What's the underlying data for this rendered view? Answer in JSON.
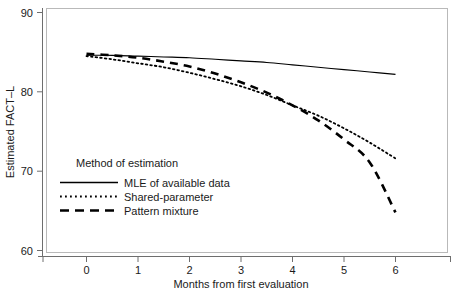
{
  "chart_data": {
    "type": "line",
    "title": "",
    "xlabel": "Months from first evaluation",
    "ylabel": "Estimated FACT–L",
    "xlim": [
      -0.65,
      6.65
    ],
    "ylim": [
      59.0,
      90.6
    ],
    "xticks": [
      0,
      1,
      2,
      3,
      4,
      5,
      6
    ],
    "xtick_labels": [
      "0",
      "1",
      "2",
      "3",
      "4",
      "5",
      "6"
    ],
    "yticks": [
      60,
      70,
      80,
      90
    ],
    "ytick_labels": [
      "60",
      "70",
      "80",
      "90"
    ],
    "grid": false,
    "legend_position": "inside-lower-left",
    "legend_title": "Method of estimation",
    "x": [
      0,
      0.5,
      1,
      1.5,
      2,
      2.5,
      3,
      3.5,
      4,
      4.5,
      5,
      5.5,
      6
    ],
    "series": [
      {
        "name": "MLE of available data",
        "style": "solid",
        "color": "#000000",
        "values": [
          84.6,
          84.6,
          84.5,
          84.4,
          84.3,
          84.1,
          83.9,
          83.7,
          83.4,
          83.1,
          82.8,
          82.5,
          82.2
        ]
      },
      {
        "name": "Shared-parameter",
        "style": "dotted",
        "color": "#000000",
        "values": [
          84.5,
          84.1,
          83.6,
          83.1,
          82.4,
          81.6,
          80.7,
          79.6,
          78.3,
          77.0,
          75.4,
          73.6,
          71.6
        ]
      },
      {
        "name": "Pattern mixture",
        "style": "dashed",
        "color": "#000000",
        "values": [
          84.8,
          84.6,
          84.3,
          83.8,
          83.2,
          82.3,
          81.2,
          79.9,
          78.3,
          76.4,
          74.0,
          71.1,
          64.8
        ]
      }
    ]
  },
  "legend": {
    "title": "Method of estimation",
    "entries": [
      {
        "label": "MLE of available data",
        "style": "solid"
      },
      {
        "label": "Shared-parameter",
        "style": "dotted"
      },
      {
        "label": "Pattern mixture",
        "style": "dashed"
      }
    ]
  },
  "axes": {
    "x_title": "Months from first evaluation",
    "y_title": "Estimated FACT–L",
    "x_tick_labels": [
      "0",
      "1",
      "2",
      "3",
      "4",
      "5",
      "6"
    ],
    "y_tick_labels": [
      "90",
      "80",
      "70",
      "60"
    ]
  },
  "colors": {
    "line": "#000000",
    "frame": "#b9b9b9",
    "axis": "#6e6e6e",
    "text": "#1a1a1a",
    "background": "#ffffff"
  }
}
